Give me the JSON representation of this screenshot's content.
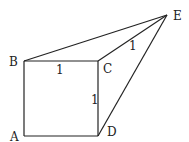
{
  "diagram": {
    "points": {
      "A": {
        "label": "A",
        "x": 24,
        "y": 136
      },
      "B": {
        "label": "B",
        "x": 24,
        "y": 61
      },
      "C": {
        "label": "C",
        "x": 98,
        "y": 61
      },
      "D": {
        "label": "D",
        "x": 98,
        "y": 136
      },
      "E": {
        "label": "E",
        "x": 167,
        "y": 15
      }
    },
    "edges": [
      "AB",
      "BC",
      "CD",
      "DA",
      "BE",
      "CE",
      "DE"
    ],
    "lengths": {
      "BC": "1",
      "CD": "1",
      "CE": "1"
    }
  }
}
